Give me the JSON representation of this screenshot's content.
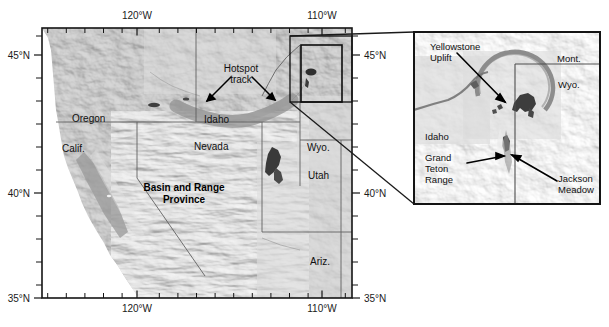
{
  "figure": {
    "type": "shaded-relief-map",
    "region": "Western United States — Yellowstone hotspot track",
    "background_color": "#ffffff",
    "frame_color": "#1a1a1a"
  },
  "main_map": {
    "name": "western-us-relief-map",
    "axes": {
      "x_ticks_labeled": [
        "120°W",
        "110°W"
      ],
      "y_ticks_labeled": [
        "45°N",
        "40°N",
        "35°N"
      ],
      "x_label_top": [
        "120°W",
        "110°W"
      ],
      "x_label_bottom": [
        "120°W",
        "110°W"
      ],
      "y_label_left": [
        "45°N",
        "40°N",
        "35°N"
      ],
      "y_label_right": [
        "45°N",
        "40°N",
        "35°N"
      ],
      "minor_tick_interval_deg": 1,
      "xlim_deg": [
        -125.5,
        -108.0
      ],
      "ylim_deg": [
        34.5,
        46.2
      ]
    },
    "state_labels": [
      {
        "name": "Oregon",
        "text": "Oregon"
      },
      {
        "name": "Idaho",
        "text": "Idaho"
      },
      {
        "name": "Calif",
        "text": "Calif."
      },
      {
        "name": "Nevada",
        "text": "Nevada"
      },
      {
        "name": "Wyo",
        "text": "Wyo."
      },
      {
        "name": "Utah",
        "text": "Utah"
      },
      {
        "name": "Ariz",
        "text": "Ariz."
      }
    ],
    "annotations": [
      {
        "name": "hotspot-track",
        "line1": "Hotspot",
        "line2": "track"
      },
      {
        "name": "basin-and-range-province",
        "line1": "Basin and Range",
        "line2": "Province"
      }
    ],
    "inset_locator_box": {
      "name": "inset-locator-box",
      "label": ""
    }
  },
  "inset_map": {
    "name": "yellowstone-inset-map",
    "labels": [
      {
        "name": "yellowstone-uplift",
        "line1": "Yellowstone",
        "line2": "Uplift"
      },
      {
        "name": "mont",
        "text": "Mont."
      },
      {
        "name": "wyo",
        "text": "Wyo."
      },
      {
        "name": "idaho",
        "text": "Idaho"
      },
      {
        "name": "grand-teton-range",
        "line1": "Grand",
        "line2": "Teton",
        "line3": "Range"
      },
      {
        "name": "jackson-meadow",
        "line1": "Jackson",
        "line2": "Meadow"
      }
    ]
  }
}
